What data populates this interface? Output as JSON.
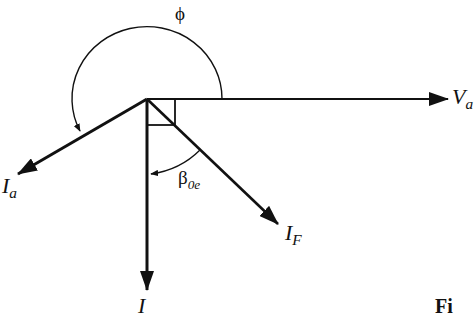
{
  "diagram": {
    "type": "phasor-diagram",
    "colors": {
      "stroke": "#111111",
      "background": "#ffffff"
    },
    "origin": {
      "x": 147,
      "y": 99
    },
    "vectors": [
      {
        "id": "Va",
        "label_main": "V",
        "label_sub": "a",
        "to": {
          "x": 448,
          "y": 99
        }
      },
      {
        "id": "Ia",
        "label_main": "I",
        "label_sub": "a",
        "to": {
          "x": 18,
          "y": 174
        }
      },
      {
        "id": "Iq",
        "label_main": "I",
        "label_sub": "",
        "to": {
          "x": 147,
          "y": 290
        }
      },
      {
        "id": "IF",
        "label_main": "I",
        "label_sub": "F",
        "to": {
          "x": 278,
          "y": 224
        }
      }
    ],
    "angles": [
      {
        "id": "phi",
        "symbol": "ϕ",
        "description": "arc from Va counter-clockwise to Ia"
      },
      {
        "id": "beta",
        "symbol_main": "β",
        "symbol_sub": "0e",
        "description": "arc from IF to vertical current"
      }
    ],
    "right_angle_markers": 2,
    "figure_caption_fragment": "Fi"
  }
}
